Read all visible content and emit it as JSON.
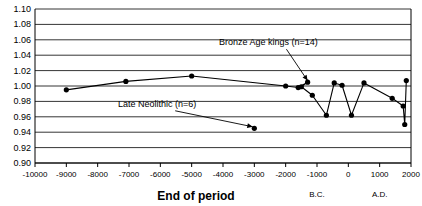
{
  "chart_data": {
    "type": "line",
    "title": "",
    "xlabel": "End of period",
    "ylabel": "",
    "xlim": [
      -10000,
      2000
    ],
    "ylim": [
      0.9,
      1.1
    ],
    "grid": true,
    "legend_position": "none",
    "xticks": [
      -10000,
      -9000,
      -8000,
      -7000,
      -6000,
      -5000,
      -4000,
      -3000,
      -2000,
      -1000,
      0,
      1000,
      2000
    ],
    "xtick_labels": [
      "-10000",
      "-9000",
      "-8000",
      "-7000",
      "-6000",
      "-5000",
      "-4000",
      "-3000",
      "-2000",
      "-1000",
      "0",
      "1000",
      "2000"
    ],
    "yticks": [
      0.9,
      0.92,
      0.94,
      0.96,
      0.98,
      1.0,
      1.02,
      1.04,
      1.06,
      1.08,
      1.1
    ],
    "ytick_labels": [
      "0.90",
      "0.92",
      "0.94",
      "0.96",
      "0.98",
      "1.00",
      "1.02",
      "1.04",
      "1.06",
      "1.08",
      "1.10"
    ],
    "era_labels": [
      {
        "text": "B.C.",
        "x": -1000
      },
      {
        "text": "A.D.",
        "x": 1000
      }
    ],
    "series": [
      {
        "name": "main-trend",
        "marker": "filled-circle",
        "x": [
          -9000,
          -7100,
          -5000,
          -2000,
          -1600,
          -1300,
          -1500,
          -1150,
          -700,
          -450,
          -200,
          100,
          500,
          1400,
          1750,
          1800,
          1850
        ],
        "values": [
          0.995,
          1.006,
          1.013,
          1.0,
          0.998,
          1.005,
          0.999,
          0.988,
          0.962,
          1.004,
          1.001,
          0.962,
          1.004,
          0.984,
          0.974,
          0.95,
          1.007
        ]
      },
      {
        "name": "late-neolithic-point",
        "marker": "filled-circle",
        "x": [
          -3000
        ],
        "values": [
          0.945
        ]
      }
    ],
    "annotations": [
      {
        "text": "Bronze Age kings (n=14)",
        "label_x": -2550,
        "label_y": 1.053,
        "target_x": -1300,
        "target_y": 1.007
      },
      {
        "text": "Late Neolithic (n=6)",
        "label_x": -6100,
        "label_y": 0.973,
        "target_x": -3050,
        "target_y": 0.947
      }
    ]
  }
}
